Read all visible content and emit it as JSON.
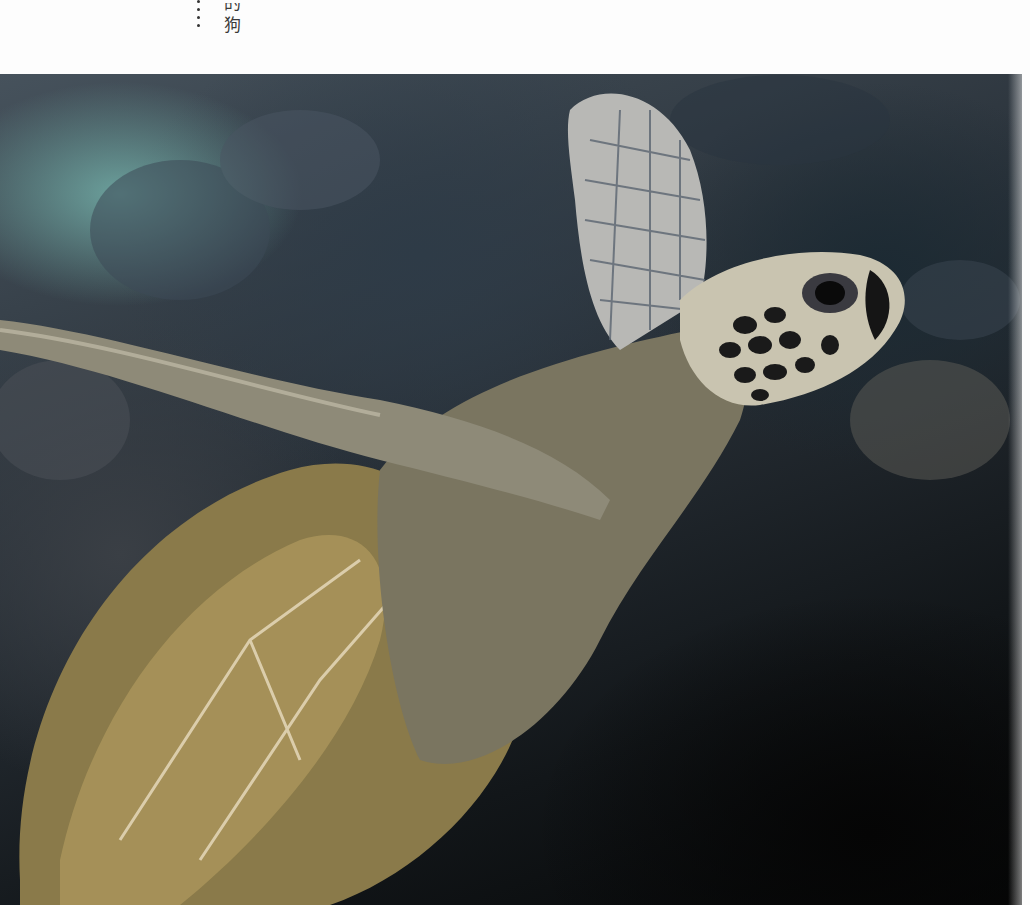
{
  "page": {
    "vertical_text": {
      "ellipsis": "……",
      "chars_visible": [
        "的",
        "狗"
      ]
    }
  },
  "photo": {
    "subject": "sea-turtle",
    "description": "Green sea turtle swimming along dark volcanic reef rock, flipper raised",
    "colors": {
      "water": "#6ea5a0",
      "rock": "#2e3b47",
      "shadow": "#050505",
      "shell": "#8a7a4a",
      "skin": "#c9c4b0",
      "scale_dark": "#1a1a1a"
    }
  }
}
